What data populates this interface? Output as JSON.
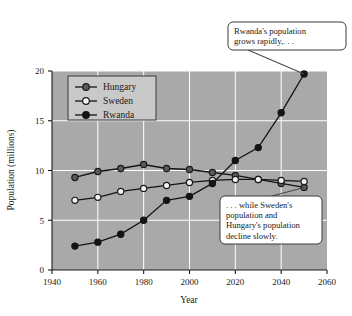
{
  "chart_data": {
    "type": "line",
    "title": "",
    "xlabel": "Year",
    "ylabel": "Population (millions)",
    "xlim": [
      1940,
      2060
    ],
    "ylim": [
      0,
      20
    ],
    "xticks": [
      1940,
      1960,
      1980,
      2000,
      2020,
      2040,
      2060
    ],
    "yticks": [
      0,
      5,
      10,
      15,
      20
    ],
    "grid": true,
    "legend_position": "top-left",
    "plot_background": "#a9a9a9",
    "gridline_color": "#ffffff",
    "x": [
      1950,
      1960,
      1970,
      1980,
      1990,
      2000,
      2010,
      2020,
      2030,
      2040,
      2050
    ],
    "series": [
      {
        "name": "Hungary",
        "marker": "filled-gray-circle",
        "color": "#555555",
        "values": [
          9.3,
          9.9,
          10.2,
          10.6,
          10.2,
          10.1,
          9.8,
          9.5,
          9.1,
          8.7,
          8.3
        ]
      },
      {
        "name": "Sweden",
        "marker": "hollow-circle",
        "color": "#f2f2f2",
        "values": [
          7.0,
          7.3,
          7.9,
          8.2,
          8.5,
          8.8,
          9.0,
          9.1,
          9.1,
          9.0,
          8.9
        ]
      },
      {
        "name": "Rwanda",
        "marker": "filled-black-circle",
        "color": "#1a1a1a",
        "values": [
          2.4,
          2.8,
          3.6,
          5.0,
          7.0,
          7.4,
          8.7,
          11.0,
          12.3,
          15.8,
          19.7
        ]
      }
    ],
    "annotations": [
      {
        "id": "rwanda-callout",
        "text": "Rwanda's population grows rapidly,. . .",
        "lines": [
          "Rwanda's population",
          "grows rapidly,. . ."
        ],
        "points_to_year": 2050,
        "points_to_value": 19.7
      },
      {
        "id": "decline-callout",
        "text": ". . . while Sweden's population and Hungary's population decline slowly.",
        "lines": [
          ". . . while Sweden's",
          "population and",
          "Hungary's population",
          "decline slowly."
        ],
        "points_to_year": 2050,
        "points_to_value": 8.3
      }
    ]
  }
}
